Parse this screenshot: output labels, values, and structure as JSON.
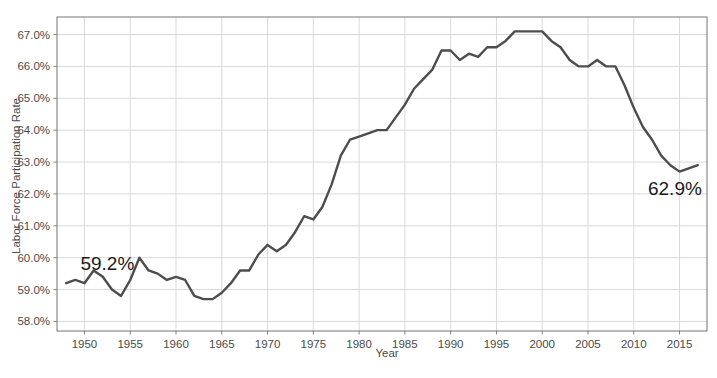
{
  "chart_data": {
    "type": "line",
    "title": "",
    "subtitle": "",
    "xlabel": "Year",
    "ylabel": "Labor Force Participation Rate",
    "xlim": [
      1947.0,
      2018.0
    ],
    "ylim": [
      57.7,
      67.55
    ],
    "grid": true,
    "legend": null,
    "line_color": "#4d4d4d",
    "grid_color": "#d9d9d9",
    "axis_color": "#808080",
    "text_color": "#4a4a4a",
    "xticks": [
      1950,
      1955,
      1960,
      1965,
      1970,
      1975,
      1980,
      1985,
      1990,
      1995,
      2000,
      2005,
      2010,
      2015
    ],
    "xtick_labels": [
      "1950",
      "1955",
      "1960",
      "1965",
      "1970",
      "1975",
      "1980",
      "1985",
      "1990",
      "1995",
      "2000",
      "2005",
      "2010",
      "2015"
    ],
    "yticks": [
      58,
      59,
      60,
      61,
      62,
      63,
      64,
      65,
      66,
      67
    ],
    "ytick_labels": [
      "58.0%",
      "59.0%",
      "60.0%",
      "61.0%",
      "62.0%",
      "63.0%",
      "64.0%",
      "65.0%",
      "66.0%",
      "67.0%"
    ],
    "annotations": [
      {
        "text": "59.2%",
        "x": 1950,
        "y": 59.2,
        "position": "upper-left"
      },
      {
        "text": "62.9%",
        "x": 2017,
        "y": 62.9,
        "position": "lower-right"
      }
    ],
    "series": [
      {
        "name": "Labor Force Participation Rate",
        "x": [
          1948,
          1949,
          1950,
          1951,
          1952,
          1953,
          1954,
          1955,
          1956,
          1957,
          1958,
          1959,
          1960,
          1961,
          1962,
          1963,
          1964,
          1965,
          1966,
          1967,
          1968,
          1969,
          1970,
          1971,
          1972,
          1973,
          1974,
          1975,
          1976,
          1977,
          1978,
          1979,
          1980,
          1981,
          1982,
          1983,
          1984,
          1985,
          1986,
          1987,
          1988,
          1989,
          1990,
          1991,
          1992,
          1993,
          1994,
          1995,
          1996,
          1997,
          1998,
          1999,
          2000,
          2001,
          2002,
          2003,
          2004,
          2005,
          2006,
          2007,
          2008,
          2009,
          2010,
          2011,
          2012,
          2013,
          2014,
          2015,
          2016,
          2017
        ],
        "y": [
          59.2,
          59.3,
          59.2,
          59.6,
          59.4,
          59.0,
          58.8,
          59.3,
          60.0,
          59.6,
          59.5,
          59.3,
          59.4,
          59.3,
          58.8,
          58.7,
          58.7,
          58.9,
          59.2,
          59.6,
          59.6,
          60.1,
          60.4,
          60.2,
          60.4,
          60.8,
          61.3,
          61.2,
          61.6,
          62.3,
          63.2,
          63.7,
          63.8,
          63.9,
          64.0,
          64.0,
          64.4,
          64.8,
          65.3,
          65.6,
          65.9,
          66.5,
          66.5,
          66.2,
          66.4,
          66.3,
          66.6,
          66.6,
          66.8,
          67.1,
          67.1,
          67.1,
          67.1,
          66.8,
          66.6,
          66.2,
          66.0,
          66.0,
          66.2,
          66.0,
          66.0,
          65.4,
          64.7,
          64.1,
          63.7,
          63.2,
          62.9,
          62.7,
          62.8,
          62.9
        ]
      }
    ]
  },
  "axis": {
    "y_title": "Labor Force Participation Rate",
    "x_title": "Year"
  }
}
